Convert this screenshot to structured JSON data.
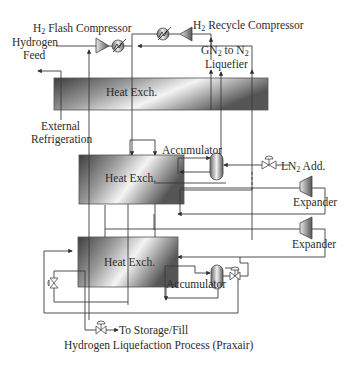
{
  "diagram": {
    "title": "Hydrogen Liquefaction Process (Praxair)",
    "labels": {
      "flash_compressor": {
        "pre": "H",
        "sub": "2",
        "post": " Flash Compressor"
      },
      "recycle_compressor": {
        "pre": "H",
        "sub": "2",
        "post": " Recycle Compressor"
      },
      "hydrogen_feed_line1": "Hydrogen",
      "hydrogen_feed_line2": "Feed",
      "gn2_line1": {
        "a": "GN",
        "a_sub": "2",
        "b": " to N",
        "b_sub": "2"
      },
      "gn2_line2": "Liquefier",
      "external_refrigeration_line1": "External",
      "external_refrigeration_line2": "Refrigeration",
      "accumulator_upper": "Accumulator",
      "accumulator_lower": "Accumulator",
      "ln2_add": {
        "pre": "LN",
        "sub": "2",
        "post": " Add."
      },
      "expander_upper": "Expander",
      "expander_lower": "Expander",
      "to_storage": "To Storage/Fill"
    },
    "heat_exchangers": [
      {
        "id": "hx1",
        "label": "Heat Exch."
      },
      {
        "id": "hx2",
        "label": "Heat Exch."
      },
      {
        "id": "hx3",
        "label": "Heat Exch."
      }
    ],
    "icons": [
      "compressor-icon",
      "cooler-icon",
      "valve-icon",
      "vessel-icon",
      "expander-icon"
    ],
    "colors": {
      "line": "#3a3a3a",
      "hx_dark": "#4a4a4a",
      "hx_light": "#f2f2f2",
      "text": "#2b2b2b"
    }
  }
}
